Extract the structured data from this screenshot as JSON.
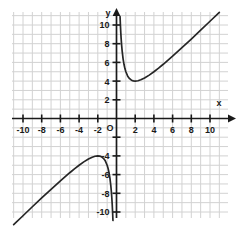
{
  "figure": {
    "background_color": "#ffffff",
    "grid_color": "#d2d2d2",
    "axis_color": "#1a1a1a",
    "curve_color": "#262626"
  },
  "axes": {
    "x_axis_name": "x",
    "y_axis_name": "y",
    "origin_label": "O",
    "x_tick_labels": [
      "-10",
      "-8",
      "-6",
      "-4",
      "-2",
      "2",
      "4",
      "6",
      "8",
      "10"
    ],
    "y_tick_labels": [
      "10",
      "8",
      "6",
      "4",
      "2",
      "-4",
      "-6",
      "-8",
      "-10"
    ]
  },
  "chart_data": {
    "type": "line",
    "title": "",
    "xlabel": "x",
    "ylabel": "y",
    "xlim": [
      -11.5,
      11.5
    ],
    "ylim": [
      -11,
      11
    ],
    "grid": true,
    "grid_step": 1,
    "tick_step": 2,
    "legend": "none",
    "annotations": [
      "vertical asymptote at x = 0",
      "slant asymptote y = x",
      "local minimum at (2, 4)",
      "local maximum at (-2, -4)"
    ],
    "series": [
      {
        "name": "branch-right",
        "x": [
          0.38,
          0.42,
          0.46,
          0.5,
          0.55,
          0.6,
          0.7,
          0.8,
          0.9,
          1.0,
          1.2,
          1.4,
          1.6,
          1.8,
          2.0,
          2.3,
          2.6,
          3.0,
          3.5,
          4.0,
          4.5,
          5.0,
          6.0,
          7.0,
          8.0,
          9.0,
          10.0,
          11.0
        ],
        "y": [
          10.9,
          9.94,
          9.16,
          8.5,
          7.82,
          7.27,
          6.41,
          5.8,
          5.34,
          5.0,
          4.53,
          4.26,
          4.1,
          4.02,
          4.0,
          4.04,
          4.14,
          4.33,
          4.64,
          5.0,
          5.39,
          5.8,
          6.67,
          7.57,
          8.5,
          9.44,
          10.4,
          11.36
        ]
      },
      {
        "name": "branch-left",
        "x": [
          -11.0,
          -10.0,
          -9.0,
          -8.0,
          -7.0,
          -6.0,
          -5.0,
          -4.5,
          -4.0,
          -3.5,
          -3.0,
          -2.6,
          -2.3,
          -2.0,
          -1.8,
          -1.6,
          -1.4,
          -1.2,
          -1.0,
          -0.9,
          -0.8,
          -0.7,
          -0.6,
          -0.55,
          -0.5,
          -0.46,
          -0.42,
          -0.38
        ],
        "y": [
          -11.36,
          -10.4,
          -9.44,
          -8.5,
          -7.57,
          -6.67,
          -5.8,
          -5.39,
          -5.0,
          -4.64,
          -4.33,
          -4.14,
          -4.04,
          -4.0,
          -4.02,
          -4.1,
          -4.26,
          -4.53,
          -5.0,
          -5.34,
          -5.8,
          -6.41,
          -7.27,
          -7.82,
          -8.5,
          -9.16,
          -9.94,
          -10.9
        ]
      }
    ]
  }
}
